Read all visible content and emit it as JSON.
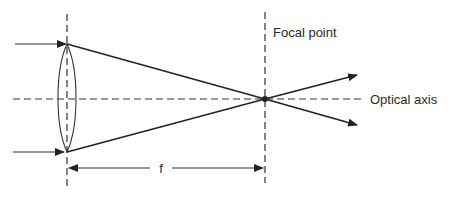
{
  "diagram": {
    "labels": {
      "focal_point": "Focal point",
      "optical_axis": "Optical axis",
      "focal_length": "f"
    },
    "elements": {
      "lens": "convex-lens",
      "incoming_rays": 2,
      "outgoing_rays": 2
    },
    "colors": {
      "line": "#222222",
      "background": "#ffffff"
    }
  }
}
